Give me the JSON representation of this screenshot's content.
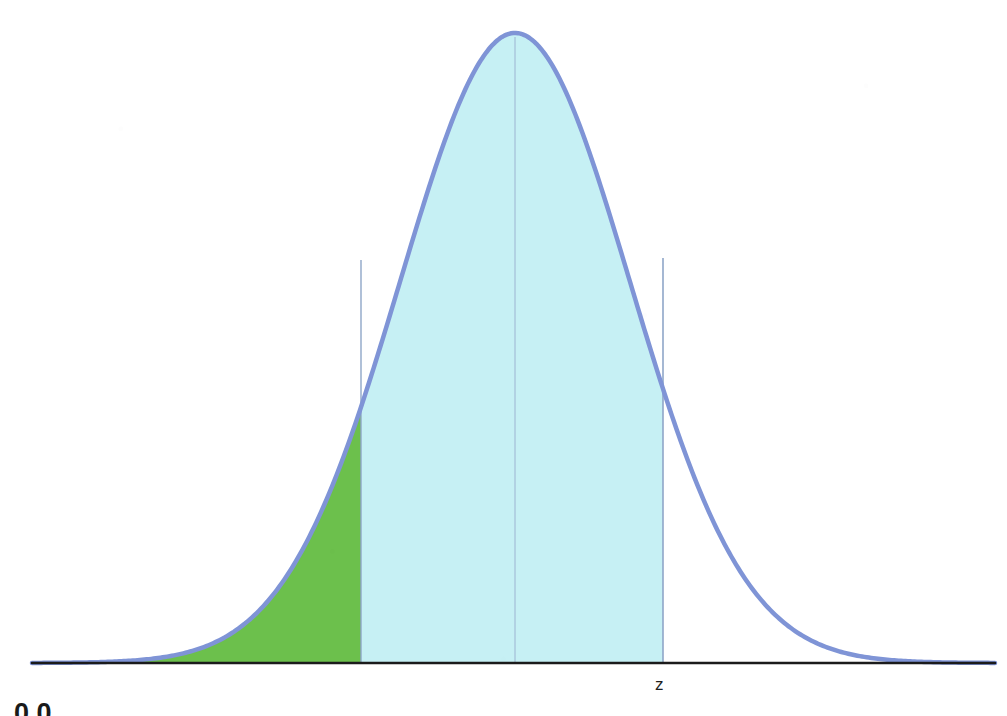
{
  "figure": {
    "kind": "normal-distribution-curve",
    "background_color": "#ffffff",
    "axis_label_z": "z",
    "page_fragment_text": "0.0"
  },
  "colors": {
    "curve_stroke": "#7f94d6",
    "left_tail_fill": "#6cc04c",
    "center_band_fill": "#c6f0f4",
    "axis_line": "#1b1b1b",
    "center_line": "#9bb2cf",
    "boundary_line": "#8fa6c8",
    "label_text": "#1f1f1f"
  },
  "geometry": {
    "axis_y": 663,
    "axis_x_start": 32,
    "axis_x_end": 995,
    "peak_x": 515,
    "peak_y": 33,
    "green_left_x": 72,
    "green_right_x": 361,
    "green_right_curve_y": 260,
    "blue_right_x": 663,
    "blue_right_curve_y": 258,
    "center_line_x": 515,
    "curve_stroke_width": 4.5
  },
  "chart_data": {
    "type": "area",
    "title": "",
    "subtitle": "",
    "xlabel": "",
    "ylabel": "",
    "xlim": [
      -4,
      4
    ],
    "ylim": [
      0,
      0.4
    ],
    "grid": false,
    "legend": "none",
    "distribution": {
      "name": "standard normal",
      "mean": 0,
      "sd": 1,
      "peak_density": 0.3989
    },
    "x": [
      -4,
      -3.75,
      -3.5,
      -3.25,
      -3,
      -2.75,
      -2.5,
      -2.25,
      -2,
      -1.75,
      -1.5,
      -1.25,
      -1,
      -0.75,
      -0.5,
      -0.25,
      0,
      0.25,
      0.5,
      0.75,
      1,
      1.25,
      1.5,
      1.75,
      2,
      2.25,
      2.5,
      2.75,
      3,
      3.25,
      3.5,
      3.75,
      4
    ],
    "series": [
      {
        "name": "standard normal density",
        "values": [
          0.0001,
          0.0004,
          0.0009,
          0.002,
          0.0044,
          0.0091,
          0.0175,
          0.0317,
          0.054,
          0.0863,
          0.1295,
          0.1826,
          0.242,
          0.3011,
          0.3521,
          0.3867,
          0.3989,
          0.3867,
          0.3521,
          0.3011,
          0.242,
          0.1826,
          0.1295,
          0.0863,
          0.054,
          0.0317,
          0.0175,
          0.0091,
          0.0044,
          0.002,
          0.0009,
          0.0004,
          0.0001
        ]
      }
    ],
    "shaded_regions": [
      {
        "name": "left-tail-green",
        "color": "#6cc04c",
        "x_from": -3.8,
        "x_to": -1.28,
        "approx_area": 0.1
      },
      {
        "name": "center-band-cyan",
        "color": "#c6f0f4",
        "x_from": -1.28,
        "x_to": 1.29,
        "approx_area": 0.8
      }
    ],
    "annotations": [
      {
        "name": "z-boundary-label",
        "text": "z",
        "x": 1.29,
        "y": 0
      },
      {
        "name": "center-reference-line",
        "text": "",
        "x": 0
      }
    ]
  }
}
